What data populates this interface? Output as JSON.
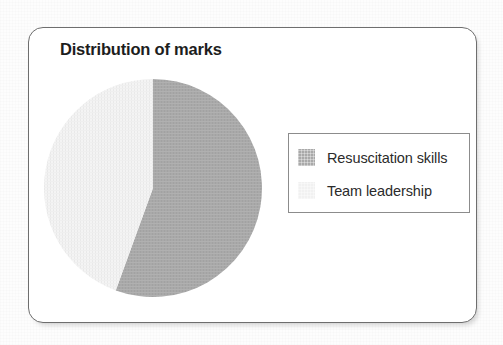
{
  "figure": {
    "title": "Distribution of marks",
    "frame_border_color": "#6e6e6e",
    "background_color": "#ffffff"
  },
  "legend": {
    "position": "right",
    "border_color": "#8c8c8c",
    "entries": [
      {
        "label": "Resuscitation skills",
        "color": "#a9a9a9"
      },
      {
        "label": "Team leadership",
        "color": "#f1f1f1"
      }
    ]
  },
  "chart_data": {
    "type": "pie",
    "title": "Distribution of marks",
    "xlabel": "",
    "ylabel": "",
    "grid": false,
    "legend_position": "right",
    "start_angle_deg": 0,
    "direction": "clockwise",
    "categories": [
      "Resuscitation skills",
      "Team leadership"
    ],
    "values": [
      55.6,
      44.4
    ],
    "units": "percent",
    "slices": [
      {
        "name": "Resuscitation skills",
        "value": 55.6,
        "sweep_deg": 200,
        "start_deg": 0,
        "end_deg": 200,
        "color": "#a9a9a9"
      },
      {
        "name": "Team leadership",
        "value": 44.4,
        "sweep_deg": 160,
        "start_deg": 200,
        "end_deg": 360,
        "color": "#f1f1f1"
      }
    ],
    "annotations": []
  }
}
